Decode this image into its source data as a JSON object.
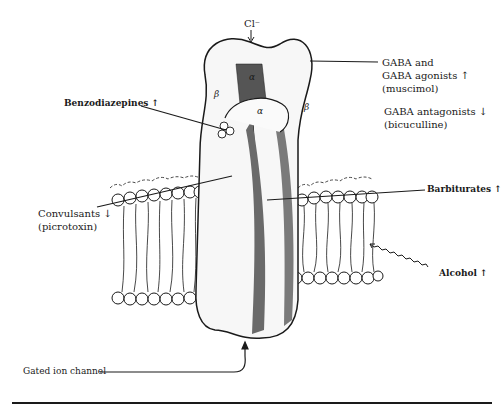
{
  "diagram": {
    "type": "GABA-A receptor / chloride ion channel illustration",
    "ion": {
      "label": "Cl⁻",
      "arrow": "down"
    },
    "subunits": [
      {
        "label": "β",
        "position": "top-left"
      },
      {
        "label": "α",
        "position": "top-center-back"
      },
      {
        "label": "α",
        "position": "top-center-front"
      },
      {
        "label": "β",
        "position": "top-right"
      }
    ],
    "labels": {
      "gaba_line1": "GABA and",
      "gaba_line2": "GABA agonists ↑",
      "gaba_line3": "(muscimol)",
      "antag_line1": "GABA antagonists ↓",
      "antag_line2": "(bicuculline)",
      "benzo": "Benzodiazepines ↑",
      "barb": "Barbiturates ↑",
      "convuls_line1": "Convulsants ↓",
      "convuls_line2": "(picrotoxin)",
      "alcohol": "Alcohol ↑",
      "gated": "Gated ion channel"
    },
    "colors": {
      "ink": "#1a1a1a",
      "background": "#ffffff"
    }
  }
}
